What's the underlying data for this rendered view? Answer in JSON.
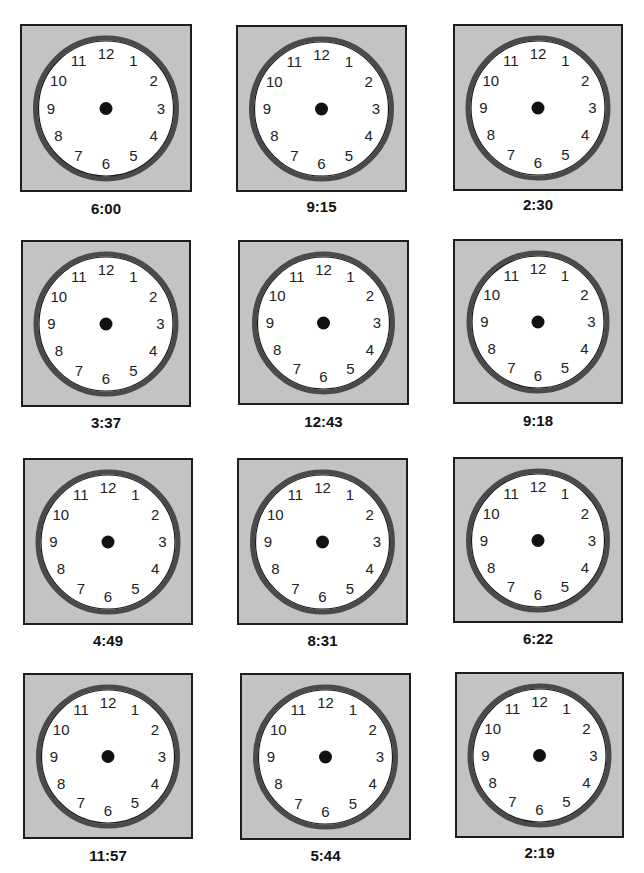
{
  "worksheet": {
    "header_text_clipped": "",
    "clock_face": {
      "numbers": [
        "12",
        "1",
        "2",
        "3",
        "4",
        "5",
        "6",
        "7",
        "8",
        "9",
        "10",
        "11"
      ],
      "colors": {
        "background": "#c3c3c3",
        "border": "#1e1e1e",
        "ring": "#4a4a4a",
        "ring_inner": "#1a1a1a",
        "face": "#ffffff",
        "center_dot": "#111111",
        "numbers": "#222222"
      }
    },
    "clocks": [
      {
        "time": "6:00",
        "box": [
          20,
          24,
          172,
          168
        ],
        "label_y": 200
      },
      {
        "time": "9:15",
        "box": [
          236,
          25,
          171,
          167
        ],
        "label_y": 198
      },
      {
        "time": "2:30",
        "box": [
          453,
          24,
          170,
          167
        ],
        "label_y": 196
      },
      {
        "time": "3:37",
        "box": [
          21,
          240,
          170,
          167
        ],
        "label_y": 414
      },
      {
        "time": "12:43",
        "box": [
          238,
          240,
          171,
          165
        ],
        "label_y": 413
      },
      {
        "time": "9:18",
        "box": [
          453,
          239,
          170,
          165
        ],
        "label_y": 412
      },
      {
        "time": "4:49",
        "box": [
          23,
          458,
          170,
          167
        ],
        "label_y": 632
      },
      {
        "time": "8:31",
        "box": [
          237,
          458,
          171,
          167
        ],
        "label_y": 632
      },
      {
        "time": "6:22",
        "box": [
          453,
          457,
          170,
          166
        ],
        "label_y": 630
      },
      {
        "time": "11:57",
        "box": [
          23,
          673,
          170,
          166
        ],
        "label_y": 847
      },
      {
        "time": "5:44",
        "box": [
          240,
          673,
          171,
          167
        ],
        "label_y": 847
      },
      {
        "time": "2:19",
        "box": [
          455,
          672,
          169,
          166
        ],
        "label_y": 844
      }
    ]
  }
}
